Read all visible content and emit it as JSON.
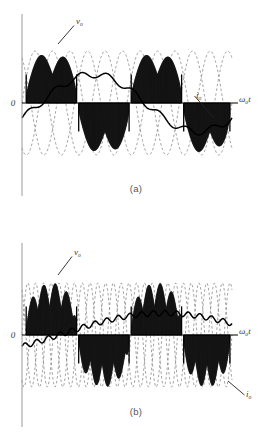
{
  "figure": {
    "title": "",
    "panels": [
      {
        "id": "a",
        "caption": "(a)",
        "origin_label": "0",
        "axis_label": "ω",
        "axis_label_sub": "o",
        "axis_label_tail": "t",
        "labels": {
          "top_symbol": "v",
          "top_symbol_sub": "o",
          "right_symbol": "i",
          "right_symbol_sub": "o"
        }
      },
      {
        "id": "b",
        "caption": "(b)",
        "origin_label": "0",
        "axis_label": "ω",
        "axis_label_sub": "o",
        "axis_label_tail": "t",
        "labels": {
          "top_symbol": "v",
          "top_symbol_sub": "o",
          "right_symbol": "i",
          "right_symbol_sub": "o"
        }
      }
    ]
  },
  "chart_data": {
    "type": "line",
    "xlabel": "ωot",
    "ylabel": "",
    "grid": false,
    "legend_position": "inline-annotations",
    "colors": {
      "waveform": "#111111",
      "dashed_supply": "#8a8a8a",
      "axis": "#9a9a9a",
      "label": "#3a3a3a"
    },
    "series": [
      {
        "name": "vo",
        "role": "output voltage (hatched pulse blocks)",
        "style": "dense vertical black hatching under sinusoidal envelope",
        "panel": "a"
      },
      {
        "name": "io",
        "role": "output current (bold piecewise staircase)",
        "style": "bold solid staircase line",
        "panel": "a"
      },
      {
        "name": "supply phases",
        "role": "three-phase input sinusoids",
        "style": "dashed grey sinusoids",
        "panel": "a"
      },
      {
        "name": "vo",
        "role": "output voltage (hatched pulse blocks)",
        "style": "dense vertical black hatching under sinusoidal envelope",
        "panel": "b"
      },
      {
        "name": "io",
        "role": "output current (bold piecewise staircase)",
        "style": "bold solid staircase line",
        "panel": "b"
      },
      {
        "name": "supply phases",
        "role": "three-phase input sinusoids",
        "style": "dashed grey sinusoids",
        "panel": "b"
      }
    ],
    "panel_a": {
      "output_frequency_relative": 0.5,
      "supply_cycles_visible": 4,
      "output_cycles_visible": 2,
      "positive_blocks": [
        [
          0.02,
          0.26
        ],
        [
          0.52,
          0.76
        ]
      ],
      "negative_blocks": [
        [
          0.27,
          0.51
        ],
        [
          0.77,
          0.99
        ]
      ],
      "envelope_amplitude": 1.0,
      "current_peak": 0.55,
      "xlim": [
        0,
        1
      ],
      "ylim": [
        -1.1,
        1.1
      ]
    },
    "panel_b": {
      "output_frequency_relative": 0.25,
      "supply_cycles_visible": 9,
      "output_cycles_visible": 2,
      "positive_blocks": [
        [
          0.02,
          0.26
        ],
        [
          0.52,
          0.76
        ]
      ],
      "negative_blocks": [
        [
          0.27,
          0.51
        ],
        [
          0.77,
          0.99
        ]
      ],
      "envelope_amplitude": 1.0,
      "current_peak": 0.42,
      "xlim": [
        0,
        1
      ],
      "ylim": [
        -1.1,
        1.1
      ]
    }
  }
}
